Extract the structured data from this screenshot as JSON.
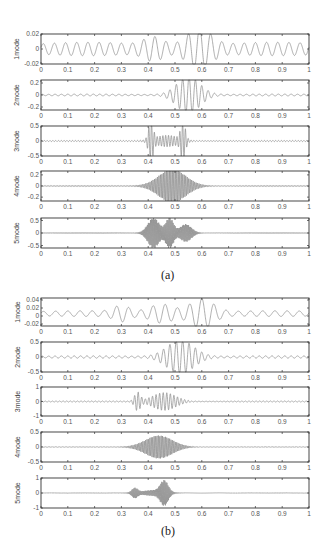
{
  "chart_data": [
    {
      "id": "a",
      "type": "line",
      "caption": "(a)",
      "xlim": [
        0,
        1
      ],
      "xticks": [
        "0",
        "0.1",
        "0.2",
        "0.3",
        "0.4",
        "0.5",
        "0.6",
        "0.7",
        "0.8",
        "0.9",
        "1"
      ],
      "grid": false,
      "line_color": "#8a8a8a",
      "subplots": [
        {
          "ylabel": "1mode",
          "ylim": [
            -0.02,
            0.02
          ],
          "yticks": [
            "0.02",
            "0",
            "-0.02"
          ],
          "yvals": [
            0.02,
            0,
            -0.02
          ],
          "signal": {
            "freq": 24,
            "base": 0.004,
            "peaks": [
              {
                "c": 0.59,
                "w": 0.06,
                "a": 0.024
              },
              {
                "c": 0.42,
                "w": 0.05,
                "a": 0.011
              }
            ],
            "tail": 0.005
          }
        },
        {
          "ylabel": "2mode",
          "ylim": [
            -0.25,
            0.25
          ],
          "yticks": [
            "0.2",
            "0",
            "-0.2"
          ],
          "yvals": [
            0.2,
            0,
            -0.2
          ],
          "signal": {
            "freq": 42,
            "base": 0.005,
            "peaks": [
              {
                "c": 0.55,
                "w": 0.06,
                "a": 0.3
              }
            ],
            "tail": 0.01
          }
        },
        {
          "ylabel": "3mode",
          "ylim": [
            -0.5,
            0.5
          ],
          "yticks": [
            "0.5",
            "0",
            "-0.5"
          ],
          "yvals": [
            0.5,
            0,
            -0.5
          ],
          "signal": {
            "freq": 95,
            "base": 0.01,
            "peaks": [
              {
                "c": 0.41,
                "w": 0.012,
                "a": 0.6
              },
              {
                "c": 0.53,
                "w": 0.012,
                "a": 0.6
              },
              {
                "c": 0.47,
                "w": 0.06,
                "a": 0.18
              }
            ],
            "tail": 0.01
          }
        },
        {
          "ylabel": "4mode",
          "ylim": [
            -0.27,
            0.27
          ],
          "yticks": [
            "0.2",
            "0",
            "-0.2"
          ],
          "yvals": [
            0.2,
            0,
            -0.2
          ],
          "signal": {
            "freq": 180,
            "base": 0.003,
            "peaks": [
              {
                "c": 0.49,
                "w": 0.07,
                "a": 0.3
              }
            ],
            "tail": 0.006
          }
        },
        {
          "ylabel": "5mode",
          "ylim": [
            -0.6,
            0.6
          ],
          "yticks": [
            "0.5",
            "0",
            "-0.5"
          ],
          "yvals": [
            0.5,
            0,
            -0.5
          ],
          "signal": {
            "freq": 260,
            "base": 0.005,
            "peaks": [
              {
                "c": 0.42,
                "w": 0.03,
                "a": 0.6
              },
              {
                "c": 0.48,
                "w": 0.02,
                "a": 0.6
              },
              {
                "c": 0.54,
                "w": 0.03,
                "a": 0.35
              }
            ],
            "tail": 0.01
          }
        }
      ]
    },
    {
      "id": "b",
      "type": "line",
      "caption": "(b)",
      "xlim": [
        0,
        1
      ],
      "xticks": [
        "0",
        "0.1",
        "0.2",
        "0.3",
        "0.4",
        "0.5",
        "0.6",
        "0.7",
        "0.8",
        "0.9",
        "1"
      ],
      "grid": false,
      "line_color": "#8a8a8a",
      "subplots": [
        {
          "ylabel": "1mode",
          "ylim": [
            -0.025,
            0.045
          ],
          "yticks": [
            "0.04",
            "0.02",
            "0",
            "-0.02"
          ],
          "yvals": [
            0.04,
            0.02,
            0,
            -0.02
          ],
          "signal": {
            "offset": 0.006,
            "freq": 22,
            "base": 0.003,
            "peaks": [
              {
                "c": 0.6,
                "w": 0.06,
                "a": 0.034
              },
              {
                "c": 0.45,
                "w": 0.06,
                "a": 0.02
              },
              {
                "c": 0.3,
                "w": 0.04,
                "a": 0.015
              }
            ],
            "tail": 0.004
          }
        },
        {
          "ylabel": "2mode",
          "ylim": [
            -0.5,
            0.5
          ],
          "yticks": [
            "0.5",
            "0",
            "-0.5"
          ],
          "yvals": [
            0.5,
            0,
            -0.5
          ],
          "signal": {
            "freq": 42,
            "base": 0.01,
            "peaks": [
              {
                "c": 0.52,
                "w": 0.07,
                "a": 0.55
              }
            ],
            "tail": 0.03
          }
        },
        {
          "ylabel": "3mode",
          "ylim": [
            -1,
            1
          ],
          "yticks": [
            "1",
            "0",
            "-1"
          ],
          "yvals": [
            1,
            0,
            -1
          ],
          "signal": {
            "freq": 75,
            "base": 0.01,
            "peaks": [
              {
                "c": 0.36,
                "w": 0.015,
                "a": 0.6
              },
              {
                "c": 0.46,
                "w": 0.06,
                "a": 0.6
              }
            ],
            "tail": 0.03
          }
        },
        {
          "ylabel": "4mode",
          "ylim": [
            -0.5,
            0.5
          ],
          "yticks": [
            "0.5",
            "0",
            "-0.5"
          ],
          "yvals": [
            0.5,
            0,
            -0.5
          ],
          "signal": {
            "freq": 190,
            "base": 0.003,
            "peaks": [
              {
                "c": 0.44,
                "w": 0.07,
                "a": 0.38
              }
            ],
            "tail": 0.006
          }
        },
        {
          "ylabel": "5mode",
          "ylim": [
            -1,
            1
          ],
          "yticks": [
            "1",
            "0",
            "-1"
          ],
          "yvals": [
            1,
            0,
            -1
          ],
          "signal": {
            "freq": 260,
            "base": 0.005,
            "peaks": [
              {
                "c": 0.35,
                "w": 0.015,
                "a": 0.3
              },
              {
                "c": 0.46,
                "w": 0.02,
                "a": 0.75
              },
              {
                "c": 0.42,
                "w": 0.06,
                "a": 0.18
              }
            ],
            "tail": 0.01
          }
        }
      ]
    }
  ],
  "layout": {
    "plot_left": 41,
    "plot_right": 309,
    "groups": [
      {
        "tops": [
          34,
          80,
          126,
          171,
          218
        ],
        "heights": [
          30,
          30,
          30,
          30,
          30
        ],
        "caption_y": 268
      },
      {
        "tops": [
          298,
          342,
          387,
          432,
          478
        ],
        "heights": [
          28,
          30,
          29,
          30,
          30
        ],
        "caption_y": 524
      }
    ]
  }
}
